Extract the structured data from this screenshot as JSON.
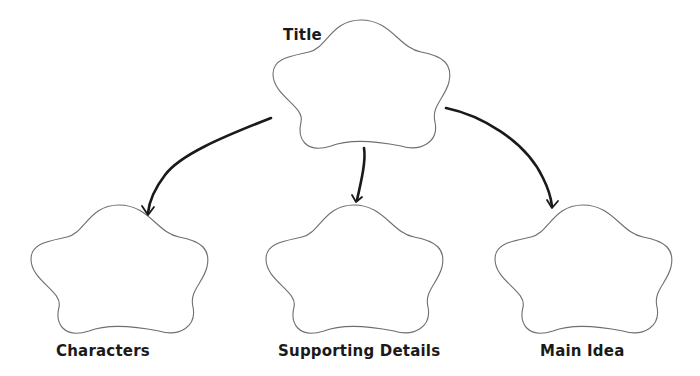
{
  "diagram": {
    "type": "graphic-organizer",
    "nodes": [
      {
        "id": "title",
        "label": "Title",
        "shape": "cloud"
      },
      {
        "id": "characters",
        "label": "Characters",
        "shape": "cloud"
      },
      {
        "id": "supporting",
        "label": "Supporting Details",
        "shape": "cloud"
      },
      {
        "id": "main",
        "label": "Main Idea",
        "shape": "cloud"
      }
    ],
    "edges": [
      {
        "from": "title",
        "to": "characters"
      },
      {
        "from": "title",
        "to": "supporting"
      },
      {
        "from": "title",
        "to": "main"
      }
    ],
    "colors": {
      "outline": "#6f6f6f",
      "arrow": "#1a1a1a",
      "text": "#1a1a1a",
      "background": "#ffffff"
    }
  }
}
